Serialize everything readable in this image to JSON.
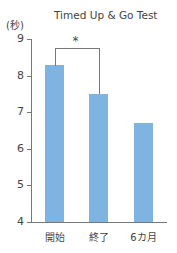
{
  "chart_data": {
    "type": "bar",
    "title": "Timed Up & Go Test",
    "xlabel": "",
    "ylabel": "(秒)",
    "ylim": [
      4,
      9
    ],
    "yticks": [
      "4",
      "5",
      "6",
      "7",
      "8",
      "9"
    ],
    "categories": [
      "開始",
      "終了",
      "6カ月"
    ],
    "values": [
      8.3,
      7.5,
      6.7
    ],
    "bar_color": "#7fb3e2",
    "grid": false,
    "legend": null,
    "annotations": [
      {
        "type": "significance-bracket",
        "from": "開始",
        "to": "終了",
        "label": "*"
      }
    ]
  }
}
